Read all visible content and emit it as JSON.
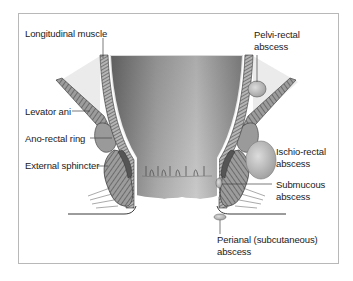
{
  "figure": {
    "labels": {
      "longitudinal_muscle": "Longitudinal muscle",
      "levator_ani": "Levator ani",
      "ano_rectal_ring": "Ano-rectal ring",
      "external_sphincter": "External sphincter",
      "pelvi_rectal_abscess_1": "Pelvi-rectal",
      "pelvi_rectal_abscess_2": "abscess",
      "ischio_rectal_abscess_1": "Ischio-rectal",
      "ischio_rectal_abscess_2": "abscess",
      "submucous_abscess_1": "Submucous",
      "submucous_abscess_2": "abscess",
      "perianal_abscess_1": "Perianal (subcutaneous)",
      "perianal_abscess_2": "abscess"
    },
    "colors": {
      "lumen_dark": "#7a7a7a",
      "lumen_light": "#d9d9d9",
      "muscle": "#8c8c8c",
      "fat": "#ececec",
      "outline": "#333333",
      "frame": "#b8b8b8"
    }
  }
}
